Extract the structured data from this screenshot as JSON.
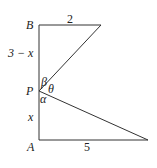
{
  "diagram": {
    "type": "geometry",
    "points": {
      "B": {
        "label": "B"
      },
      "P": {
        "label": "P"
      },
      "A": {
        "label": "A"
      }
    },
    "segments": {
      "top": {
        "label": "2"
      },
      "bottom": {
        "label": "5"
      },
      "upper_vertical": {
        "label": "3 − x"
      },
      "lower_vertical": {
        "label": "x"
      }
    },
    "angles": {
      "beta": {
        "label": "β"
      },
      "theta": {
        "label": "θ"
      },
      "alpha": {
        "label": "α"
      }
    },
    "colors": {
      "line": "#333333",
      "text": "#222222",
      "background": "#ffffff"
    }
  }
}
